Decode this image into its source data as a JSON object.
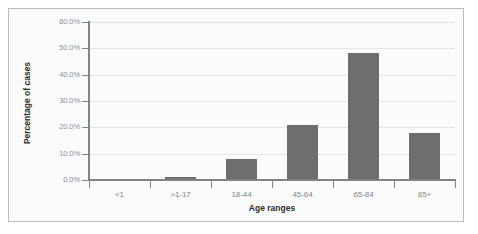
{
  "chart_data": {
    "type": "bar",
    "title": "",
    "xlabel": "Age ranges",
    "ylabel": "Percentage of cases",
    "categories": [
      "<1",
      ">1-17",
      "18-44",
      "45-64",
      "65-84",
      "85+"
    ],
    "values": [
      0.4,
      1.2,
      8.0,
      20.8,
      48.2,
      17.8
    ],
    "ylim": [
      0,
      60
    ],
    "ytick_labels": [
      "60.0%",
      "50.0%",
      "40.0%",
      "30.0%",
      "20.0%",
      "10.0%",
      "0.0%"
    ],
    "ytick_values": [
      60,
      50,
      40,
      30,
      20,
      10,
      0
    ],
    "grid": true,
    "legend": "none",
    "bar_color": "#6e6e6e",
    "axis_color": "#808487",
    "gridline_color": "#e4e5e6",
    "plot_background": "#fbfbfb",
    "border_color": "#b9bcbe"
  }
}
